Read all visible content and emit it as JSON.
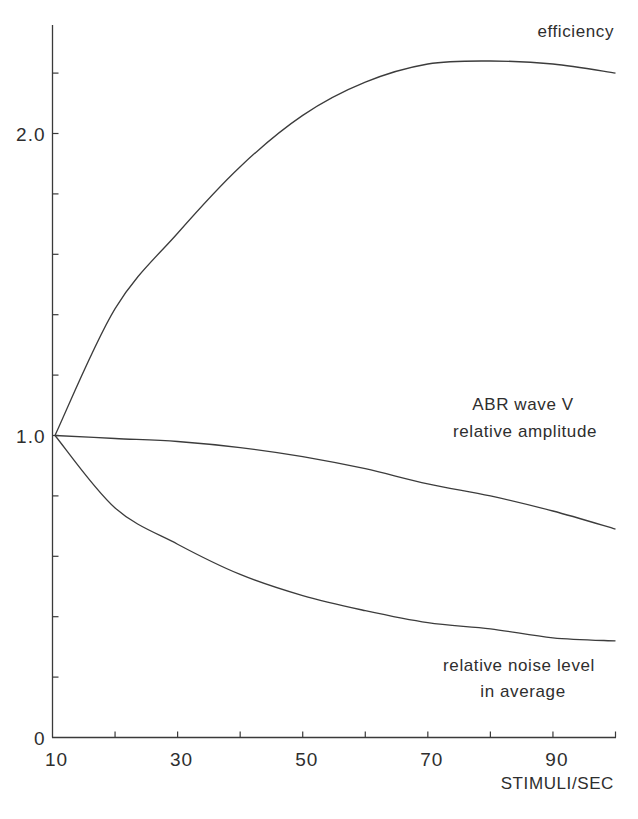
{
  "chart_data": {
    "type": "line",
    "title": "",
    "xlabel": "STIMULI/SEC",
    "ylabel": "",
    "xlim": [
      10,
      100
    ],
    "ylim": [
      0,
      2.4
    ],
    "grid": false,
    "x_ticks": [
      10,
      20,
      30,
      40,
      50,
      60,
      70,
      80,
      90,
      100
    ],
    "x_tick_labels": [
      {
        "value": 10,
        "label": "10"
      },
      {
        "value": 30,
        "label": "30"
      },
      {
        "value": 50,
        "label": "50"
      },
      {
        "value": 70,
        "label": "70"
      },
      {
        "value": 90,
        "label": "90"
      }
    ],
    "y_ticks": [
      0,
      0.2,
      0.4,
      0.6,
      0.8,
      1.0,
      1.2,
      1.4,
      1.6,
      1.8,
      2.0,
      2.2
    ],
    "y_tick_labels": [
      {
        "value": 0,
        "label": "0"
      },
      {
        "value": 1.0,
        "label": "1.0"
      },
      {
        "value": 2.0,
        "label": "2.0"
      }
    ],
    "x": [
      10,
      20,
      30,
      40,
      50,
      60,
      70,
      80,
      90,
      100
    ],
    "series": [
      {
        "name": "efficiency",
        "label_lines": [
          "efficiency"
        ],
        "values": [
          1.0,
          1.42,
          1.67,
          1.89,
          2.06,
          2.17,
          2.23,
          2.24,
          2.23,
          2.2
        ]
      },
      {
        "name": "ABR wave V relative amplitude",
        "label_lines": [
          "ABR wave V",
          "relative amplitude"
        ],
        "values": [
          1.0,
          0.99,
          0.98,
          0.96,
          0.93,
          0.89,
          0.84,
          0.8,
          0.75,
          0.69
        ]
      },
      {
        "name": "relative noise level in average",
        "label_lines": [
          "relative noise level",
          "in average"
        ],
        "values": [
          1.0,
          0.76,
          0.64,
          0.54,
          0.47,
          0.42,
          0.38,
          0.36,
          0.33,
          0.32
        ]
      }
    ]
  }
}
